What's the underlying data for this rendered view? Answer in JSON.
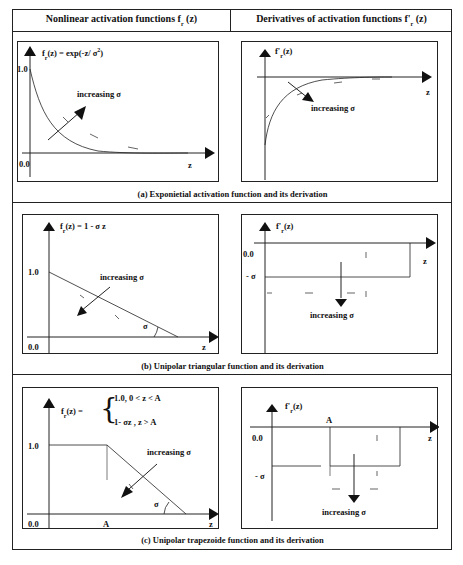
{
  "header": {
    "left_title": "Nonlinear activation functions f",
    "left_sub": "r",
    "left_arg": " (z)",
    "right_title": "Derivatives of activation functions f",
    "right_prime": "'",
    "right_sub": "r",
    "right_arg": " (z)"
  },
  "panels": {
    "a": {
      "caption": "(a)  Exponietial activation function and its derivation",
      "left": {
        "formula_f": "f",
        "formula_sub": "r",
        "formula_rest": "(z) = exp(-z/ σ",
        "formula_sup": "2",
        "formula_close": ")",
        "y_tick": "1.0",
        "origin": "0.0",
        "x_label": "z",
        "annotation": "increasing  σ"
      },
      "right": {
        "formula_f": "f",
        "formula_prime": "'",
        "formula_sub": "r",
        "formula_rest": "(z)",
        "x_label": "z",
        "annotation": "increasing  σ"
      }
    },
    "b": {
      "caption": "(b)  Unipolar triangular function and its derivation",
      "left": {
        "formula_f": "f",
        "formula_sub": "r",
        "formula_rest": "(z) = 1 -  σ z",
        "y_tick": "1.0",
        "origin": "0.0",
        "x_label": "z",
        "angle_label": "σ",
        "annotation": "increasing  σ"
      },
      "right": {
        "formula_f": "f",
        "formula_prime": "'",
        "formula_sub": "r",
        "formula_rest": "(z)",
        "zero_tick": "0.0",
        "neg_tick": "- σ",
        "x_label": "z",
        "annotation": "increasing  σ"
      }
    },
    "c": {
      "caption": "(c)  Unipolar trapezoide function and its derivation",
      "left": {
        "formula_f": "f",
        "formula_sub": "r",
        "formula_rest": "(z) =",
        "case1": "1.0,  0 < z < A",
        "case2": "1- σz ,  z > A",
        "y_tick": "1.0",
        "origin": "0.0",
        "a_label": "A",
        "x_label": "z",
        "angle_label": "σ",
        "annotation": "increasing  σ"
      },
      "right": {
        "formula_f": "f",
        "formula_prime": "'",
        "formula_sub": "r",
        "formula_rest": "(z)",
        "a_label": "A",
        "zero_tick": "0.0",
        "neg_tick": "- σ",
        "x_label": "z",
        "annotation": "increasing  σ"
      }
    }
  },
  "colors": {
    "line": "#222222",
    "background": "#ffffff"
  }
}
